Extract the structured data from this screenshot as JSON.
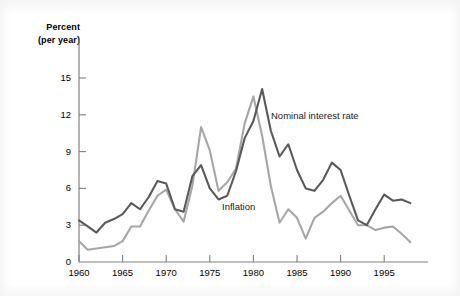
{
  "chart_data": {
    "type": "line",
    "title": "",
    "subtitle": "",
    "xlabel": "",
    "ylabel": "Percent (per year)",
    "ylabel_line1": "Percent",
    "ylabel_line2": "(per year)",
    "xlim": [
      1960,
      1998
    ],
    "ylim": [
      0,
      16
    ],
    "grid": false,
    "legend_position": "inline-annotation",
    "yticks": [
      0,
      3,
      6,
      9,
      12,
      15
    ],
    "ytick_labels": [
      "0",
      "3",
      "6",
      "9",
      "12",
      "15"
    ],
    "xticks": [
      1960,
      1965,
      1970,
      1975,
      1980,
      1985,
      1990,
      1995
    ],
    "xtick_labels": [
      "1960",
      "1965",
      "1970",
      "1975",
      "1980",
      "1985",
      "1990",
      "1995"
    ],
    "x": [
      1960,
      1961,
      1962,
      1963,
      1964,
      1965,
      1966,
      1967,
      1968,
      1969,
      1970,
      1971,
      1972,
      1973,
      1974,
      1975,
      1976,
      1977,
      1978,
      1979,
      1980,
      1981,
      1982,
      1983,
      1984,
      1985,
      1986,
      1987,
      1988,
      1989,
      1990,
      1991,
      1992,
      1993,
      1994,
      1995,
      1996,
      1997,
      1998
    ],
    "series": [
      {
        "name": "Nominal interest rate",
        "color": "#595959",
        "label_x": 1983.5,
        "label_y": 11.2,
        "values": [
          3.4,
          2.9,
          2.4,
          3.2,
          3.5,
          3.9,
          4.8,
          4.3,
          5.3,
          6.6,
          6.4,
          4.3,
          4.1,
          7.0,
          7.9,
          6.0,
          5.1,
          5.4,
          7.4,
          10.1,
          11.5,
          14.1,
          10.7,
          8.6,
          9.6,
          7.5,
          6.0,
          5.8,
          6.7,
          8.1,
          7.5,
          5.4,
          3.4,
          3.0,
          4.3,
          5.5,
          5.0,
          5.1,
          4.8
        ]
      },
      {
        "name": "Inflation",
        "color": "#a6a6a6",
        "label_x": 1975.0,
        "label_y": 4.4,
        "values": [
          1.7,
          1.0,
          1.1,
          1.2,
          1.3,
          1.7,
          2.9,
          2.9,
          4.2,
          5.4,
          5.9,
          4.3,
          3.3,
          6.2,
          11.0,
          9.1,
          5.8,
          6.5,
          7.6,
          11.3,
          13.5,
          10.3,
          6.2,
          3.2,
          4.3,
          3.6,
          1.9,
          3.6,
          4.1,
          4.8,
          5.4,
          4.2,
          3.0,
          3.0,
          2.6,
          2.8,
          2.9,
          2.3,
          1.6
        ]
      }
    ],
    "geometry": {
      "plot_left": 79,
      "plot_right": 425,
      "y_zero_px": 262,
      "y_top_value": 15,
      "y_top_px": 78,
      "x_min_px_year": 1960,
      "x_px_per_year": 8.72
    }
  }
}
